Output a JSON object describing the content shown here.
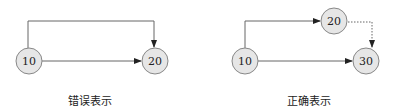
{
  "left": {
    "caption": "错误表示",
    "nodes": [
      {
        "id": "10",
        "label": "10"
      },
      {
        "id": "20",
        "label": "20"
      }
    ],
    "edges": [
      {
        "from": "10",
        "to": "20",
        "style": "solid",
        "route": "over-top"
      },
      {
        "from": "10",
        "to": "20",
        "style": "solid",
        "route": "direct"
      }
    ]
  },
  "right": {
    "caption": "正确表示",
    "nodes": [
      {
        "id": "10",
        "label": "10"
      },
      {
        "id": "20",
        "label": "20"
      },
      {
        "id": "30",
        "label": "30"
      }
    ],
    "edges": [
      {
        "from": "10",
        "to": "20",
        "style": "solid"
      },
      {
        "from": "20",
        "to": "30",
        "style": "dotted"
      },
      {
        "from": "10",
        "to": "30",
        "style": "solid"
      }
    ]
  },
  "colors": {
    "node_fill": "#e6e6e6",
    "node_stroke": "#888888",
    "edge": "#555555"
  }
}
